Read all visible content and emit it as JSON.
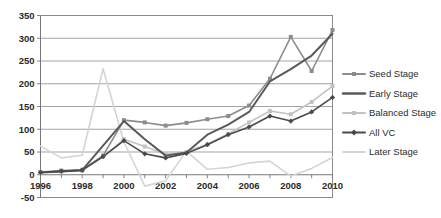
{
  "chart_data": {
    "type": "line",
    "title": "",
    "subtitle": "",
    "xlabel": "",
    "ylabel": "",
    "x": [
      1996,
      1997,
      1998,
      1999,
      2000,
      2001,
      2002,
      2003,
      2004,
      2005,
      2006,
      2007,
      2008,
      2009,
      2010
    ],
    "xtick_labels": [
      "1996",
      "1998",
      "2000",
      "2002",
      "2004",
      "2006",
      "2008",
      "2010"
    ],
    "xtick_values": [
      1996,
      1998,
      2000,
      2002,
      2004,
      2006,
      2008,
      2010
    ],
    "ytick_labels": [
      "-50",
      "0",
      "50",
      "100",
      "150",
      "200",
      "250",
      "300",
      "350"
    ],
    "ytick_values": [
      -50,
      0,
      50,
      100,
      150,
      200,
      250,
      300,
      350
    ],
    "xlim": [
      1996,
      2010
    ],
    "ylim": [
      -50,
      350
    ],
    "grid": true,
    "legend_position": "right",
    "series": [
      {
        "name": "Seed Stage",
        "color": "#8c8c8c",
        "marker": "square",
        "line_width": 1.6,
        "values": [
          6,
          9,
          11,
          42,
          120,
          115,
          108,
          114,
          122,
          129,
          152,
          211,
          303,
          228,
          318
        ]
      },
      {
        "name": "Early Stage",
        "color": "#5a5a5a",
        "marker": "none",
        "line_width": 2.0,
        "values": [
          5,
          7,
          10,
          64,
          118,
          78,
          42,
          49,
          88,
          110,
          138,
          205,
          232,
          262,
          310
        ]
      },
      {
        "name": "Balanced Stage",
        "color": "#c2c2c2",
        "marker": "square",
        "line_width": 1.6,
        "values": [
          5,
          7,
          9,
          40,
          78,
          62,
          45,
          50,
          67,
          90,
          115,
          140,
          133,
          160,
          195
        ]
      },
      {
        "name": "All VC",
        "color": "#4a4a4a",
        "marker": "diamond",
        "line_width": 1.6,
        "values": [
          5,
          8,
          10,
          40,
          75,
          46,
          37,
          47,
          66,
          88,
          105,
          129,
          118,
          138,
          170
        ]
      },
      {
        "name": "Later Stage",
        "color": "#d4d4d4",
        "marker": "none",
        "line_width": 1.6,
        "values": [
          63,
          37,
          43,
          233,
          72,
          -25,
          -13,
          52,
          12,
          16,
          26,
          30,
          -3,
          14,
          38
        ]
      }
    ]
  },
  "legend": {
    "entries": [
      {
        "label": "Seed Stage"
      },
      {
        "label": "Early Stage"
      },
      {
        "label": "Balanced Stage"
      },
      {
        "label": "All VC"
      },
      {
        "label": "Later Stage"
      }
    ]
  }
}
